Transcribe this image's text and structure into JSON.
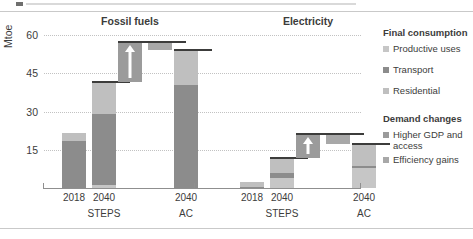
{
  "chart_data": {
    "type": "bar",
    "title": "",
    "ylabel": "Mtoe",
    "xlabel": "",
    "ylim": [
      0,
      62
    ],
    "yticks": [
      15,
      30,
      45,
      60
    ],
    "grid": true,
    "legend_position": "right",
    "panels": [
      {
        "name": "Fossil fuels",
        "categories": [
          "2018",
          "2040",
          "",
          "2040"
        ],
        "group_labels": [
          "",
          "STEPS",
          "",
          "AC"
        ],
        "bars": [
          {
            "label": "2018",
            "type": "stacked",
            "base": 0,
            "segments": [
              {
                "series": "Transport",
                "value": 18.3
              },
              {
                "series": "Residential",
                "value": 3.4
              }
            ],
            "total": 21.7,
            "cap": false
          },
          {
            "label": "2040 STEPS",
            "type": "stacked",
            "base": 0,
            "segments": [
              {
                "series": "Productive uses",
                "value": 1.0
              },
              {
                "series": "Transport",
                "value": 28.1
              },
              {
                "series": "Residential",
                "value": 12.6
              }
            ],
            "total": 41.7,
            "cap": true
          },
          {
            "label": "Higher GDP and access",
            "type": "floating",
            "series": "Higher GDP and access",
            "base": 41.7,
            "top": 57.4,
            "value": 15.7,
            "arrow": "up",
            "cap": true
          },
          {
            "label": "Efficiency gains",
            "type": "floating",
            "series": "Efficiency gains",
            "base": 54.2,
            "top": 57.4,
            "value": -3.2,
            "arrow": "none",
            "cap": true
          },
          {
            "label": "2040 AC",
            "type": "stacked",
            "base": 0,
            "segments": [
              {
                "series": "Transport",
                "value": 40.3
              },
              {
                "series": "Residential",
                "value": 13.9
              }
            ],
            "total": 54.2,
            "cap": true
          }
        ]
      },
      {
        "name": "Electricity",
        "categories": [
          "2018",
          "2040",
          "",
          "2040"
        ],
        "group_labels": [
          "",
          "STEPS",
          "",
          "AC"
        ],
        "bars": [
          {
            "label": "2018",
            "type": "stacked",
            "base": 0,
            "segments": [
              {
                "series": "Transport",
                "value": 0.3
              },
              {
                "series": "Residential",
                "value": 2.1
              }
            ],
            "total": 2.4,
            "cap": false
          },
          {
            "label": "2040 STEPS",
            "type": "stacked",
            "base": 0,
            "segments": [
              {
                "series": "Productive uses",
                "value": 4.1
              },
              {
                "series": "Transport",
                "value": 1.6
              },
              {
                "series": "Residential",
                "value": 6.1
              }
            ],
            "total": 11.8,
            "cap": true
          },
          {
            "label": "Higher GDP and access",
            "type": "floating",
            "series": "Higher GDP and access",
            "base": 11.8,
            "top": 21.0,
            "value": 9.2,
            "arrow": "up",
            "cap": true
          },
          {
            "label": "Efficiency gains",
            "type": "floating",
            "series": "Efficiency gains",
            "base": 17.2,
            "top": 21.0,
            "value": -3.8,
            "arrow": "none",
            "cap": true
          },
          {
            "label": "2040 AC",
            "type": "stacked",
            "base": 0,
            "segments": [
              {
                "series": "Productive uses",
                "value": 8.0
              },
              {
                "series": "Transport",
                "value": 0.7
              },
              {
                "series": "Residential",
                "value": 8.5
              }
            ],
            "total": 17.2,
            "cap": true
          }
        ]
      }
    ],
    "series_colors": {
      "Productive uses": "#c6c6c6",
      "Transport": "#8c8c8c",
      "Residential": "#bfbfbf",
      "Higher GDP and access": "#9b9b9b",
      "Efficiency gains": "#a8a8a8"
    }
  },
  "axis": {
    "ylabel": "Mtoe",
    "yticks": [
      "15",
      "30",
      "45",
      "60"
    ]
  },
  "panel_titles": {
    "fossil": "Fossil fuels",
    "electricity": "Electricity"
  },
  "xlabels": {
    "f_2018": "2018",
    "f_2040_steps": "2040",
    "f_steps_group": "STEPS",
    "f_2040_ac": "2040",
    "f_ac_group": "AC",
    "e_2018": "2018",
    "e_2040_steps": "2040",
    "e_steps_group": "STEPS",
    "e_2040_ac": "2040",
    "e_ac_group": "AC"
  },
  "legend": {
    "group1_title": "Final consumption",
    "group1_items": [
      {
        "label": "Productive uses",
        "color": "#c6c6c6"
      },
      {
        "label": "Transport",
        "color": "#8c8c8c"
      },
      {
        "label": "Residential",
        "color": "#bfbfbf"
      }
    ],
    "group2_title": "Demand changes",
    "group2_items": [
      {
        "label": "Higher GDP and access",
        "color": "#9b9b9b"
      },
      {
        "label": "Efficiency gains",
        "color": "#a8a8a8"
      }
    ]
  }
}
